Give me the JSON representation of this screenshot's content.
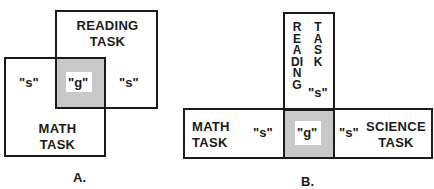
{
  "diagram_a": {
    "caption": "A.",
    "reading_task": {
      "line1": "READING",
      "line2": "TASK"
    },
    "math_task": {
      "line1": "MATH",
      "line2": "TASK"
    },
    "specific_left": "\"s\"",
    "general": "\"g\"",
    "specific_right": "\"s\""
  },
  "diagram_b": {
    "caption": "B.",
    "reading_task": {
      "col1": "READING",
      "col2": "TASK"
    },
    "reading_specific": "\"s\"",
    "math_task": {
      "line1": "MATH",
      "line2": "TASK"
    },
    "math_specific": "\"s\"",
    "general": "\"g\"",
    "science_specific": "\"s\"",
    "science_task": {
      "line1": "SCIENCE",
      "line2": "TASK"
    }
  },
  "colors": {
    "stroke": "#1a1a1a",
    "overlap_fill": "#c8c8c8",
    "background": "#ffffff"
  }
}
